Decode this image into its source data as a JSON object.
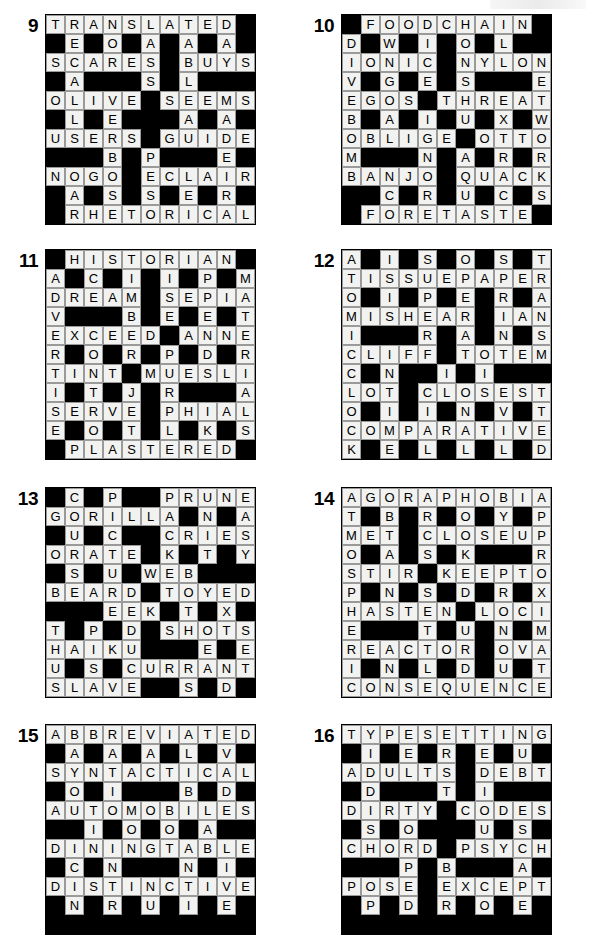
{
  "page": {
    "background_color": "#ffffff",
    "block_color": "#000000",
    "light_cell_color": "#f2f2f0",
    "grid_line_color": "#9a9a9a"
  },
  "puzzles": [
    {
      "number": "9",
      "rows": 11,
      "cols": 11,
      "grid": [
        "TRANSLATED#",
        "#E#O#A#A#A#",
        "SCARES#BUYS",
        "#A###S#L###",
        "OLIVE#SEEMS",
        "#L#E###A#A#",
        "USERS#GUIDE",
        "###B#P###E#",
        "NOGO#ECLAIR",
        "#A#S#S#E#R#",
        "#RHETORICAL"
      ]
    },
    {
      "number": "10",
      "rows": 11,
      "cols": 11,
      "grid": [
        "#FOODCHAIN#",
        "D#W#I#O#L##",
        "IONIC#NYLON",
        "V#G#E#S###E",
        "EGOS#THREAT",
        "B#A#I#U#X#W",
        "OBLIGE#OTTO",
        "M###N#A#R#R",
        "BANJO#QUACK",
        "##C#R#U#C#S",
        "#FORETASTE#"
      ]
    },
    {
      "number": "11",
      "rows": 11,
      "cols": 11,
      "grid": [
        "#HISTORIAN#",
        "A#C#I#I#P#M",
        "DREAM#SEPIA",
        "V###B#E#E#T",
        "EXCEED#ANNE",
        "R#O#R#P#D#R",
        "TINT#MUESLI",
        "I#T#J#R###A",
        "SERVE#PHIAL",
        "E#O#T#L#K#S",
        "#PLASTERED#"
      ]
    },
    {
      "number": "12",
      "rows": 11,
      "cols": 11,
      "grid": [
        "A#I#S#O#S#T",
        "TISSUEPAPER",
        "O#I#P#E#R#A",
        "MISHEAR#IAN",
        "I###R#A#N#S",
        "CLIFF#TOTEM",
        "C#N##I#I###",
        "LOT#CLOSEST",
        "O#I#I#N#V#T",
        "COMPARATIVE",
        "K#E#L#L#L#D"
      ]
    },
    {
      "number": "13",
      "rows": 11,
      "cols": 11,
      "grid": [
        "#C#P##PRUNE",
        "GORILLA#N#A",
        "#U#C##CRIES",
        "ORATE#K#T#Y",
        "#S#U#WEB###",
        "BEARD#TOYED",
        "###EEK#T#X#",
        "T#P#D#SHOTS",
        "HAIKU###E#E",
        "U#S#CURRANT",
        "SLAVE##S#D#"
      ]
    },
    {
      "number": "14",
      "rows": 11,
      "cols": 11,
      "grid": [
        "AGORAPHOBIA",
        "T#B#R#O#Y#P",
        "MET#CLOSEUP",
        "O#A#S#K###R",
        "STIR#KEEPTO",
        "P#N#S#D#R#X",
        "HASTEN#LOCI",
        "E###T#U#N#M",
        "REACTOR#OVA",
        "I#N#L#D#U#T",
        "CONSEQUENCE"
      ]
    },
    {
      "number": "15",
      "rows": 11,
      "cols": 11,
      "grid": [
        "ABBREVIATED",
        "#A#A#A#L#V#",
        "SYNTACTICAL",
        "#O#I###B#D#",
        "AUTOMOBILES",
        "##I#O#O#A##",
        "DININGTABLE",
        "#C#N###N#I#",
        "DISTINCTIVE",
        "#N#R#U#I#E#",
        "###########"
      ]
    },
    {
      "number": "16",
      "rows": 11,
      "cols": 11,
      "grid": [
        "TYPESETTING",
        "#I#E#R#E#U#",
        "ADULTS#DEBT",
        "#D###T#I###",
        "DIRTY#CODES",
        "#S#O###U#S#",
        "CHORD#PSYCH",
        "###P#B###A#",
        "POSE#EXCEPT",
        "#P#D#R#O#E#",
        "###########"
      ]
    }
  ]
}
